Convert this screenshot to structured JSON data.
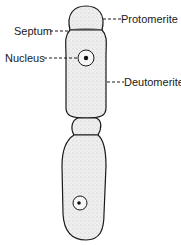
{
  "diagram": {
    "colors": {
      "outline": "#1a1a1a",
      "cytoplasm_fill": "#ececec",
      "background": "#ffffff"
    },
    "labels": {
      "protomerite": "Protomerite",
      "septum": "Septum",
      "nucleus": "Nucleus",
      "deutomerite": "Deutomerite"
    },
    "parts": [
      {
        "name": "Protomerite",
        "cell": "upper"
      },
      {
        "name": "Septum",
        "cell": "upper"
      },
      {
        "name": "Nucleus",
        "cell": "upper"
      },
      {
        "name": "Deutomerite",
        "cell": "upper"
      },
      {
        "name": "Nucleus",
        "cell": "lower",
        "labeled": false
      }
    ]
  }
}
